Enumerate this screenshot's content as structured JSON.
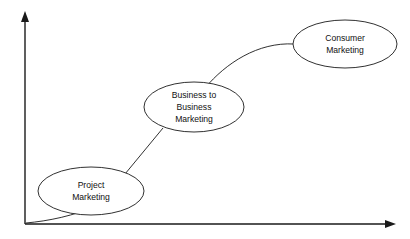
{
  "diagram": {
    "type": "progression-curve",
    "title": "",
    "background_color": "#ffffff",
    "line_color": "#1a1a1a",
    "text_color": "#111111",
    "axes": {
      "y_axis": {
        "name": "y-axis",
        "label": "",
        "arrow": "up",
        "x": 25,
        "y_top": 13,
        "y_bottom": 224
      },
      "x_axis": {
        "name": "x-axis",
        "label": "",
        "arrow": "right",
        "y": 224,
        "x_left": 25,
        "x_right": 396
      }
    },
    "nodes": [
      {
        "id": "project-marketing",
        "name": "node-project-marketing",
        "lines": [
          "Project",
          "Marketing"
        ],
        "cx": 91,
        "cy": 191,
        "rx": 53,
        "ry": 24
      },
      {
        "id": "business-to-business-marketing",
        "name": "node-business-to-business-marketing",
        "lines": [
          "Business to",
          "Business",
          "Marketing"
        ],
        "cx": 194,
        "cy": 107,
        "rx": 50,
        "ry": 25
      },
      {
        "id": "consumer-marketing",
        "name": "node-consumer-marketing",
        "lines": [
          "Consumer",
          "Marketing"
        ],
        "cx": 345,
        "cy": 44,
        "rx": 52,
        "ry": 24
      }
    ],
    "connectors": [
      {
        "id": "origin-to-project",
        "name": "connector-origin-to-project",
        "shape": "curve",
        "from": "origin",
        "to": "project-marketing"
      },
      {
        "id": "project-to-business",
        "name": "connector-project-to-business",
        "shape": "straight",
        "from": "project-marketing",
        "to": "business-to-business-marketing"
      },
      {
        "id": "business-to-consumer",
        "name": "connector-business-to-consumer",
        "shape": "curve",
        "from": "business-to-business-marketing",
        "to": "consumer-marketing"
      }
    ]
  }
}
